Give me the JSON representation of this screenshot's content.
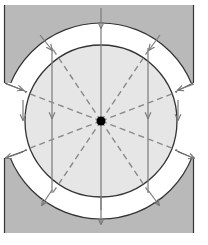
{
  "diagram": {
    "colors": {
      "background": "#ffffff",
      "outer_block": "#b9b9b9",
      "ring": "#ffffff",
      "inner_disc": "#e6e6e6",
      "outline": "#3a3a3a",
      "flow_line": "#7a7a7a",
      "dashed_line": "#8a8a8a",
      "center_dot": "#000000"
    },
    "center": {
      "x": 101,
      "y": 121
    },
    "inner_radius": 76,
    "outer_radius": 98,
    "vertical_lines_x": [
      23,
      52,
      101,
      148,
      178
    ],
    "radial_angles_deg": [
      30,
      60,
      120,
      150,
      210,
      240,
      300,
      330
    ],
    "labels": []
  }
}
